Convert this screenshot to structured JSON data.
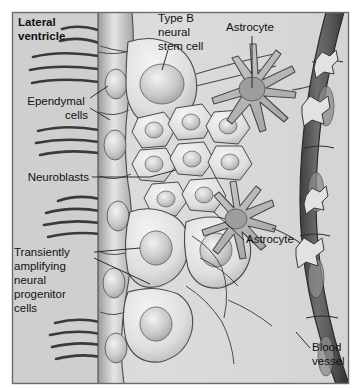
{
  "figure": {
    "background_color": "#d9d9d9",
    "frame_color": "#6b6b6b",
    "labels": [
      {
        "id": "lateral-ventricle",
        "lines": [
          "Lateral",
          "ventricle"
        ],
        "bold": true,
        "align": "start",
        "x": 18,
        "y": 26
      },
      {
        "id": "ependymal-cells",
        "lines": [
          "Ependymal",
          "cells"
        ],
        "bold": false,
        "align": "end",
        "x": 88,
        "y": 105
      },
      {
        "id": "neuroblasts",
        "lines": [
          "Neuroblasts"
        ],
        "bold": false,
        "align": "end",
        "x": 89,
        "y": 181
      },
      {
        "id": "transiently-amplifying",
        "lines": [
          "Transiently",
          "amplifying",
          "neural",
          "progenitor",
          "cells"
        ],
        "bold": false,
        "align": "start",
        "x": 14,
        "y": 256
      },
      {
        "id": "type-b-neural-stem-cell",
        "lines": [
          "Type B",
          "neural",
          "stem cell"
        ],
        "bold": false,
        "align": "start",
        "x": 158,
        "y": 22
      },
      {
        "id": "astrocyte-top",
        "lines": [
          "Astrocyte"
        ],
        "bold": false,
        "align": "start",
        "x": 226,
        "y": 31
      },
      {
        "id": "astrocyte-lower",
        "lines": [
          "Astrocyte"
        ],
        "bold": false,
        "align": "start",
        "x": 246,
        "y": 243
      },
      {
        "id": "blood-vessel",
        "lines": [
          "Blood",
          "vessel"
        ],
        "bold": false,
        "align": "start",
        "x": 312,
        "y": 351
      }
    ],
    "structures": [
      {
        "id": "lateral-ventricle-space",
        "description": "open ventricle lumen at left of ependymal layer"
      },
      {
        "id": "ependymal-cell-layer",
        "description": "vertical column of ciliated ependymal cells"
      },
      {
        "id": "cilia",
        "description": "hair-like cilia projecting left into ventricle"
      },
      {
        "id": "type-b-neural-stem-cell",
        "description": "large pale cell contacting ventricle"
      },
      {
        "id": "neuroblast-cluster",
        "description": "chain of small polygonal neuroblasts"
      },
      {
        "id": "transiently-amplifying-cells",
        "description": "intermediate progenitor cells"
      },
      {
        "id": "astrocyte-top",
        "description": "star-shaped astrocyte with radiating processes"
      },
      {
        "id": "astrocyte-lower",
        "description": "second astrocyte near blood vessel"
      },
      {
        "id": "astrocyte-endfeet",
        "description": "star-shaped endfeet contacting the blood vessel"
      },
      {
        "id": "blood-vessel",
        "description": "dark curved vessel along the right edge"
      }
    ]
  }
}
